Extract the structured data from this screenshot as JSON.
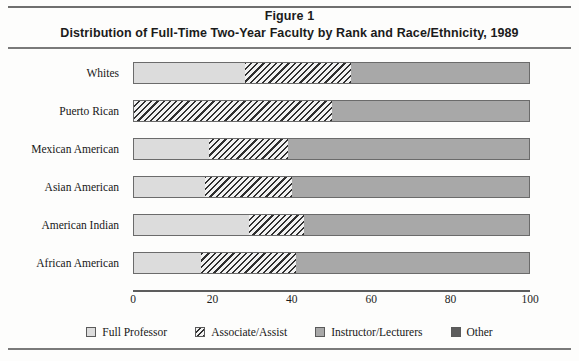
{
  "figure": {
    "title_line1": "Figure 1",
    "title_line2": "Distribution of Full-Time Two-Year Faculty by Rank and Race/Ethnicity, 1989"
  },
  "chart_data": {
    "type": "bar",
    "orientation": "horizontal",
    "stacked": true,
    "title": "Distribution of Full-Time Two-Year Faculty by Rank and Race/Ethnicity, 1989",
    "xlabel": "",
    "ylabel": "",
    "xlim": [
      0,
      100
    ],
    "xticks": [
      0,
      20,
      40,
      60,
      80,
      100
    ],
    "xtick_labels": [
      "0",
      "20",
      "40",
      "60",
      "80",
      "100"
    ],
    "grid": false,
    "legend_position": "bottom",
    "categories": [
      "Whites",
      "Puerto Rican",
      "Mexican American",
      "Asian American",
      "American Indian",
      "African American"
    ],
    "series": [
      {
        "name": "Full Professor",
        "values": [
          28,
          0,
          19,
          18,
          29,
          17
        ]
      },
      {
        "name": "Associate/Assist",
        "values": [
          27,
          50,
          20,
          22,
          14,
          24
        ]
      },
      {
        "name": "Instructor/Lecturers",
        "values": [
          45,
          50,
          61,
          60,
          57,
          59
        ]
      },
      {
        "name": "Other",
        "values": [
          0,
          0,
          0,
          0,
          0,
          0
        ]
      }
    ],
    "colors": {
      "Full Professor": "#dcdcdc",
      "Associate/Assist": "#f2f2f2",
      "Instructor/Lecturers": "#a8a8a8",
      "Other": "#5d5d5d"
    }
  },
  "legend": {
    "items": [
      {
        "label": "Full Professor"
      },
      {
        "label": "Associate/Assist"
      },
      {
        "label": "Instructor/Lecturers"
      },
      {
        "label": "Other"
      }
    ]
  }
}
